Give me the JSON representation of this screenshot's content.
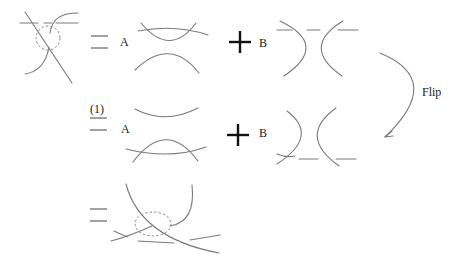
{
  "diagram": {
    "type": "skein-relation",
    "rows": [
      {
        "id": "row1",
        "lhs": "crossing-with-dashed-circle",
        "relation": "=",
        "term_a": {
          "coefficient": "A",
          "picture": "horizontal-smoothing-with-arc"
        },
        "operator": "+",
        "term_b": {
          "coefficient": "B",
          "picture": "vertical-smoothing-with-arc"
        }
      },
      {
        "id": "row2",
        "lhs_label": "(1)",
        "relation": "=",
        "term_a": {
          "coefficient": "A",
          "picture": "flipped-horizontal-smoothing"
        },
        "operator": "+",
        "term_b": {
          "coefficient": "B",
          "picture": "flipped-vertical-smoothing"
        }
      },
      {
        "id": "row3",
        "relation": "=",
        "rhs": "crossing-with-dashed-circle-below"
      }
    ],
    "labels": {
      "a": "A",
      "b": "B",
      "eq_ref": "(1)",
      "flip": "Flip"
    },
    "colors": {
      "strand": "#7a7a7a",
      "text": "#222222",
      "background": "#ffffff"
    }
  }
}
